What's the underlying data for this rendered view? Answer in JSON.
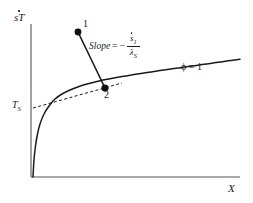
{
  "figure": {
    "background_color": "#ffffff",
    "ink_color": "#1a1a1a",
    "axis_color": "#808080",
    "width": 253,
    "height": 203
  },
  "axes": {
    "y_title": "sT",
    "x_title": "X",
    "y_tick_label": "T",
    "y_tick_sub": "S",
    "origin_px": [
      31,
      177
    ],
    "x_axis_end_px": [
      240,
      177
    ],
    "y_axis_top_px": [
      31,
      24
    ]
  },
  "annotations": {
    "slope_word": "Slope",
    "equals": "=",
    "minus": "−",
    "numerator": "s",
    "numerator_sub": "1",
    "denominator": "λ",
    "denominator_sub": "S",
    "curve_label_symbol": "ϕ",
    "curve_label_equals": "=",
    "curve_label_value": "1",
    "point1_label": "1",
    "point2_label": "2"
  },
  "chart_data": {
    "type": "line",
    "title": "",
    "xlabel": "X",
    "ylabel": "sT",
    "grid": false,
    "legend": "none",
    "xlim": [
      0,
      1
    ],
    "ylim": [
      0,
      1
    ],
    "series": [
      {
        "name": "saturation-curve-phi-1",
        "style": "solid",
        "label": "ϕ = 1",
        "points_px": [
          [
            33,
            177
          ],
          [
            34,
            160
          ],
          [
            35.5,
            146
          ],
          [
            37.5,
            134
          ],
          [
            40,
            124
          ],
          [
            44,
            114
          ],
          [
            49,
            106
          ],
          [
            55,
            99
          ],
          [
            62,
            94
          ],
          [
            70,
            90
          ],
          [
            79,
            86.5
          ],
          [
            89,
            83.5
          ],
          [
            99,
            81
          ],
          [
            110,
            78.8
          ],
          [
            122,
            76.6
          ],
          [
            134,
            74.6
          ],
          [
            147,
            72.6
          ],
          [
            160,
            70.6
          ],
          [
            174,
            68.6
          ],
          [
            188,
            66.6
          ],
          [
            202,
            64.6
          ],
          [
            216,
            62.6
          ],
          [
            230,
            60.6
          ],
          [
            240,
            59.2
          ]
        ]
      },
      {
        "name": "process-line-1-to-2",
        "style": "solid",
        "points_px": [
          [
            78,
            32
          ],
          [
            105,
            88
          ]
        ]
      },
      {
        "name": "tangent-dashed-line",
        "style": "dashed",
        "points_px": [
          [
            33,
            108
          ],
          [
            122,
            83
          ]
        ]
      }
    ],
    "points": [
      {
        "name": "point-1",
        "label": "1",
        "px": [
          78,
          32
        ],
        "marker": "filled-circle"
      },
      {
        "name": "point-2",
        "label": "2",
        "px": [
          105,
          88
        ],
        "marker": "filled-circle"
      }
    ],
    "annotations": [
      {
        "name": "slope-formula",
        "text": "Slope = − ṡ₁ / λₛ",
        "px": [
          89,
          34
        ]
      },
      {
        "name": "phi-label",
        "text": "ϕ = 1",
        "px": [
          181,
          62
        ]
      },
      {
        "name": "ts-axis-label",
        "text": "Tₛ",
        "px": [
          12,
          100
        ]
      }
    ]
  }
}
